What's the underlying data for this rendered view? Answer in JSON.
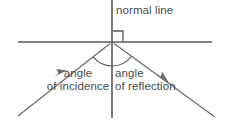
{
  "figure": {
    "background_color": "#ffffff",
    "line_color": "#58585a",
    "text_color": "#4a4a4a"
  },
  "labels": {
    "normal_line": "normal line",
    "angle_of_incidence_line1": "angle",
    "angle_of_incidence_line2": "of incidence",
    "angle_of_reflection_line1": "angle",
    "angle_of_reflection_line2": "of reflection"
  },
  "geometry": {
    "incidence_point": {
      "x": 112,
      "y": 42
    },
    "surface_line": {
      "x1": 18,
      "y1": 42,
      "x2": 212,
      "y2": 42
    },
    "normal_line": {
      "x1": 112,
      "y1": 0,
      "x2": 112,
      "y2": 118
    },
    "incident_ray": {
      "x1": 18,
      "y1": 116,
      "x2": 112,
      "y2": 42
    },
    "reflected_ray": {
      "x1": 112,
      "y1": 42,
      "x2": 215,
      "y2": 117
    },
    "right_angle_marker": {
      "x": 113,
      "y": 30,
      "size": 10
    },
    "incidence_arc_radius": 24,
    "reflection_arc_radius": 24
  },
  "arrows": {
    "incident_arrow_direction": "up-right",
    "reflected_arrow_direction": "down-right"
  }
}
